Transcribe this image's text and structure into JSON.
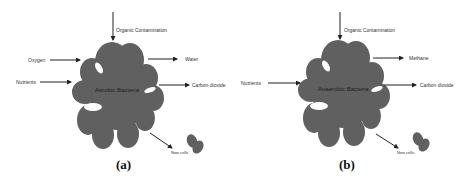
{
  "panels": [
    {
      "id": "a",
      "caption": "(a)",
      "center_label": "Aerobic Bacteria",
      "inputs": [
        "Organic Contamination",
        "Oxygen",
        "Nutrients"
      ],
      "outputs": [
        "Water",
        "Carbon dioxide",
        "New cells"
      ],
      "labels": {
        "top": "Organic Contamination",
        "left1": "Oxygen",
        "left2": "Nutrients",
        "right1": "Water",
        "right2": "Carbon dioxide",
        "bottom": "New cells"
      }
    },
    {
      "id": "b",
      "caption": "(b)",
      "center_label": "Anaerobic Bacteria",
      "inputs": [
        "Organic Contamination",
        "Nutrients"
      ],
      "outputs": [
        "Methane",
        "Carbon dioxide",
        "New cells"
      ],
      "labels": {
        "top": "Organic Contamination",
        "left2": "Nutrients",
        "right1": "Methane",
        "right2": "Carbon dioxide",
        "bottom": "New cells"
      }
    }
  ],
  "colors": {
    "bacteria_fill": "#606060",
    "arrow": "#222222",
    "text": "#333333"
  }
}
